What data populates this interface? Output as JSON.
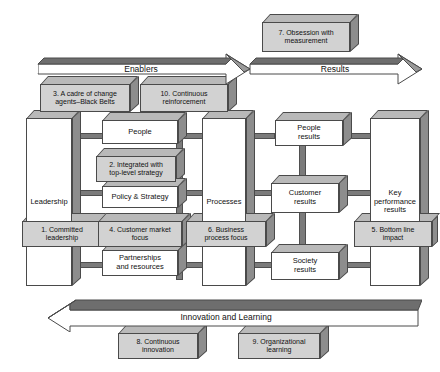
{
  "diagram": {
    "colors": {
      "block_face": "#ffffff",
      "block_face_highlight": "#d2d2d2",
      "block_top": "#b9b9b9",
      "block_side": "#8d8d8d",
      "connector": "#7b7b7b",
      "outline": "#4a4a4a"
    },
    "arrows": {
      "enablers": {
        "label": "Enablers",
        "direction": "right"
      },
      "results": {
        "label": "Results",
        "direction": "right"
      },
      "innovation": {
        "label": "Innovation and Learning",
        "direction": "left"
      }
    },
    "efqm_criteria": [
      {
        "id": "leadership",
        "label": "Leadership"
      },
      {
        "id": "people",
        "label": "People"
      },
      {
        "id": "policy-strategy",
        "label": "Policy & Strategy"
      },
      {
        "id": "partnerships",
        "label": "Partnerships\nand resources"
      },
      {
        "id": "processes",
        "label": "Processes"
      },
      {
        "id": "people-results",
        "label": "People\nresults"
      },
      {
        "id": "customer-results",
        "label": "Customer\nresults"
      },
      {
        "id": "society-results",
        "label": "Society\nresults"
      },
      {
        "id": "key-performance",
        "label": "Key\nperformance\nresults"
      }
    ],
    "six_sigma_items": [
      {
        "number": "1.",
        "label": "1. Committed\nleadership"
      },
      {
        "number": "2.",
        "label": "2. Integrated with\ntop-level strategy"
      },
      {
        "number": "3.",
        "label": "3. A cadre of change\nagents–Black Belts"
      },
      {
        "number": "4.",
        "label": "4. Customer market\nfocus"
      },
      {
        "number": "5.",
        "label": "5. Bottom line\nimpact"
      },
      {
        "number": "6.",
        "label": "6. Business\nprocess focus"
      },
      {
        "number": "7.",
        "label": "7. Obsession with\nmeasurement"
      },
      {
        "number": "8.",
        "label": "8. Continuous\ninnovation"
      },
      {
        "number": "9.",
        "label": "9. Organizational\nlearning"
      },
      {
        "number": "10.",
        "label": "10. Continuous\nreinforcement"
      }
    ],
    "labels": {
      "leadership": "Leadership",
      "people": "People",
      "policy_strategy": "Policy & Strategy",
      "partnerships": "Partnerships\nand resources",
      "processes": "Processes",
      "people_results": "People\nresults",
      "customer_results": "Customer\nresults",
      "society_results": "Society\nresults",
      "key_performance_results": "Key\nperformance\nresults",
      "ss1": "1. Committed\nleadership",
      "ss2": "2. Integrated with\ntop-level strategy",
      "ss3": "3. A cadre of change\nagents–Black Belts",
      "ss4": "4. Customer market\nfocus",
      "ss5": "5. Bottom line\nimpact",
      "ss6": "6. Business\nprocess focus",
      "ss7": "7. Obsession with\nmeasurement",
      "ss8": "8. Continuous\ninnovation",
      "ss9": "9. Organizational\nlearning",
      "ss10": "10. Continuous\nreinforcement",
      "enablers": "Enablers",
      "results": "Results",
      "innovation_learning": "Innovation and Learning"
    }
  }
}
